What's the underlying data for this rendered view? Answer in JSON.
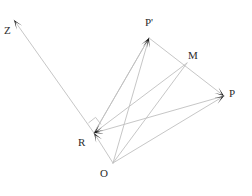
{
  "figure": {
    "type": "geometry-vector-diagram",
    "background_color": "#ffffff",
    "line_color": "#c0c0c0",
    "arrowhead_color": "#1a1a1a",
    "label_color": "#2b2b2b",
    "width": 252,
    "height": 196
  },
  "points": [
    {
      "id": "Z",
      "label": "Z",
      "x": 14,
      "y": 20,
      "label_x": 4,
      "label_y": 25
    },
    {
      "id": "Pp",
      "label": "P'",
      "x": 149,
      "y": 38,
      "label_x": 145,
      "label_y": 17
    },
    {
      "id": "M",
      "label": "M",
      "x": 187,
      "y": 63,
      "label_x": 188,
      "label_y": 50
    },
    {
      "id": "P",
      "label": "P",
      "x": 224,
      "y": 96,
      "label_x": 229,
      "label_y": 88
    },
    {
      "id": "R",
      "label": "R",
      "x": 94,
      "y": 133,
      "label_x": 78,
      "label_y": 137
    },
    {
      "id": "O",
      "label": "O",
      "x": 113,
      "y": 163,
      "label_x": 100,
      "label_y": 168
    }
  ],
  "segments": [
    {
      "name": "R-to-Z",
      "from": "R",
      "to": "Z",
      "arrow_at_end": true
    },
    {
      "name": "R-to-Pp",
      "from": "R",
      "to": "Pp",
      "arrow_at_end": true
    },
    {
      "name": "O-to-Pp",
      "from": "O",
      "to": "Pp",
      "arrow_at_end": true
    },
    {
      "name": "Pp-to-P",
      "from": "Pp",
      "to": "P",
      "arrow_at_end": true
    },
    {
      "name": "O-to-M",
      "from": "O",
      "to": "M",
      "arrow_at_end": false
    },
    {
      "name": "O-to-P",
      "from": "O",
      "to": "P",
      "arrow_at_end": true
    },
    {
      "name": "O-to-R",
      "from": "O",
      "to": "R",
      "arrow_at_end": true
    },
    {
      "name": "P-to-R",
      "from": "P",
      "to": "R",
      "arrow_at_end": true
    },
    {
      "name": "M-to-R",
      "from": "M",
      "to": "R",
      "arrow_at_end": true
    },
    {
      "name": "Pp-to-R-outer",
      "from": "Pp",
      "to": "R",
      "arrow_at_end": false
    }
  ],
  "right_angle_mark": {
    "name": "right-angle-at-R",
    "vertex_x": 94,
    "vertex_y": 130,
    "size": 9,
    "angle_a_deg": 232,
    "angle_b_deg": 322
  }
}
